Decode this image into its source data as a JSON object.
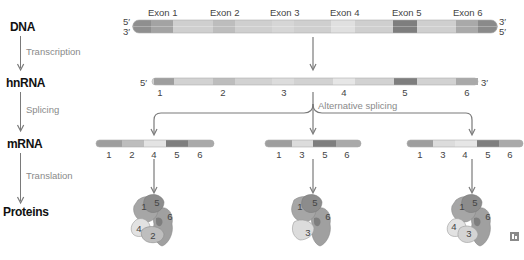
{
  "flow": {
    "stages": [
      {
        "label": "DNA"
      },
      {
        "label": "hnRNA"
      },
      {
        "label": "mRNA"
      },
      {
        "label": "Proteins"
      }
    ],
    "steps": [
      {
        "label": "Transcription"
      },
      {
        "label": "Splicing"
      },
      {
        "label": "Translation"
      }
    ]
  },
  "dna": {
    "left_top": "5′",
    "left_bottom": "3′",
    "right_top": "3′",
    "right_bottom": "5′",
    "exons": [
      "Exon 1",
      "Exon 2",
      "Exon 3",
      "Exon 4",
      "Exon 5",
      "Exon 6"
    ]
  },
  "hnrna": {
    "left_end": "5′",
    "right_end": "3′",
    "numbers": [
      "1",
      "2",
      "3",
      "4",
      "5",
      "6"
    ]
  },
  "alternative_splicing": {
    "label": "Alternative splicing"
  },
  "mrna_variants": [
    {
      "numbers": [
        "1",
        "2",
        "4",
        "5",
        "6"
      ]
    },
    {
      "numbers": [
        "1",
        "3",
        "5",
        "6"
      ]
    },
    {
      "numbers": [
        "1",
        "3",
        "4",
        "5",
        "6"
      ]
    }
  ],
  "proteins": [
    {
      "parts": [
        "1",
        "5",
        "6",
        "4",
        "2"
      ]
    },
    {
      "parts": [
        "1",
        "5",
        "6",
        "3"
      ]
    },
    {
      "parts": [
        "1",
        "5",
        "6",
        "4",
        "3"
      ]
    }
  ],
  "colors": {
    "exon1": "#9e9e9e",
    "exon2": "#bdbdbd",
    "exon3": "#d6d6d6",
    "exon4": "#e3e3e3",
    "exon5": "#7e7e7e",
    "exon6": "#a9a9a9",
    "intron": "#cfcfcf",
    "arrow": "#7a7a7a"
  }
}
